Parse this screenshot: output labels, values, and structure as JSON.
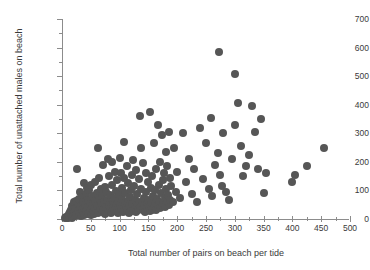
{
  "chart_data": {
    "type": "scatter",
    "title": "",
    "xlabel": "Total number of pairs on beach per tide",
    "ylabel": "Total number of unattached males on beach",
    "xlim": [
      0,
      500
    ],
    "ylim": [
      0,
      700
    ],
    "xticks": [
      0,
      50,
      100,
      150,
      200,
      250,
      300,
      350,
      400,
      450,
      500
    ],
    "xtick_labels": [
      "0",
      "50",
      "100",
      "150",
      "200",
      "250",
      "300",
      "350",
      "400",
      "450",
      "500"
    ],
    "xminor_step": 25,
    "yticks": [
      0,
      100,
      200,
      300,
      400,
      500,
      600,
      700
    ],
    "ytick_labels": [
      "0",
      "100",
      "200",
      "300",
      "400",
      "500",
      "600",
      "700"
    ],
    "yminor_step": 50,
    "grid": false,
    "legend": null,
    "marker": {
      "shape": "circle",
      "color": "#565656",
      "size_px": 8
    },
    "points": [
      [
        5,
        3
      ],
      [
        7,
        6
      ],
      [
        8,
        2
      ],
      [
        10,
        10
      ],
      [
        11,
        5
      ],
      [
        12,
        18
      ],
      [
        13,
        8
      ],
      [
        14,
        24
      ],
      [
        15,
        12
      ],
      [
        16,
        30
      ],
      [
        17,
        4
      ],
      [
        18,
        45
      ],
      [
        19,
        16
      ],
      [
        20,
        22
      ],
      [
        21,
        58
      ],
      [
        22,
        9
      ],
      [
        23,
        36
      ],
      [
        24,
        63
      ],
      [
        25,
        14
      ],
      [
        26,
        175
      ],
      [
        27,
        48
      ],
      [
        28,
        27
      ],
      [
        29,
        70
      ],
      [
        30,
        18
      ],
      [
        31,
        96
      ],
      [
        32,
        41
      ],
      [
        33,
        11
      ],
      [
        34,
        77
      ],
      [
        35,
        33
      ],
      [
        36,
        21
      ],
      [
        37,
        58
      ],
      [
        38,
        125
      ],
      [
        39,
        15
      ],
      [
        40,
        49
      ],
      [
        41,
        88
      ],
      [
        42,
        26
      ],
      [
        43,
        110
      ],
      [
        44,
        37
      ],
      [
        45,
        19
      ],
      [
        46,
        66
      ],
      [
        47,
        100
      ],
      [
        48,
        30
      ],
      [
        49,
        53
      ],
      [
        50,
        13
      ],
      [
        51,
        118
      ],
      [
        52,
        44
      ],
      [
        53,
        24
      ],
      [
        54,
        80
      ],
      [
        55,
        35
      ],
      [
        56,
        17
      ],
      [
        57,
        62
      ],
      [
        58,
        128
      ],
      [
        59,
        28
      ],
      [
        60,
        90
      ],
      [
        61,
        46
      ],
      [
        62,
        21
      ],
      [
        63,
        250
      ],
      [
        64,
        72
      ],
      [
        65,
        145
      ],
      [
        66,
        38
      ],
      [
        67,
        105
      ],
      [
        68,
        55
      ],
      [
        69,
        25
      ],
      [
        70,
        82
      ],
      [
        71,
        33
      ],
      [
        72,
        190
      ],
      [
        73,
        60
      ],
      [
        74,
        18
      ],
      [
        75,
        112
      ],
      [
        76,
        43
      ],
      [
        77,
        95
      ],
      [
        78,
        68
      ],
      [
        79,
        29
      ],
      [
        80,
        210
      ],
      [
        81,
        50
      ],
      [
        82,
        150
      ],
      [
        83,
        36
      ],
      [
        84,
        85
      ],
      [
        85,
        22
      ],
      [
        86,
        200
      ],
      [
        87,
        120
      ],
      [
        88,
        57
      ],
      [
        89,
        40
      ],
      [
        90,
        75
      ],
      [
        91,
        27
      ],
      [
        92,
        165
      ],
      [
        93,
        98
      ],
      [
        94,
        45
      ],
      [
        95,
        31
      ],
      [
        96,
        135
      ],
      [
        97,
        64
      ],
      [
        98,
        20
      ],
      [
        99,
        88
      ],
      [
        100,
        48
      ],
      [
        101,
        215
      ],
      [
        102,
        160
      ],
      [
        103,
        35
      ],
      [
        104,
        108
      ],
      [
        105,
        70
      ],
      [
        106,
        26
      ],
      [
        107,
        270
      ],
      [
        108,
        145
      ],
      [
        109,
        55
      ],
      [
        110,
        92
      ],
      [
        111,
        40
      ],
      [
        112,
        30
      ],
      [
        113,
        185
      ],
      [
        114,
        125
      ],
      [
        115,
        62
      ],
      [
        116,
        45
      ],
      [
        117,
        22
      ],
      [
        118,
        78
      ],
      [
        119,
        100
      ],
      [
        120,
        34
      ],
      [
        121,
        155
      ],
      [
        122,
        52
      ],
      [
        123,
        28
      ],
      [
        124,
        205
      ],
      [
        125,
        115
      ],
      [
        126,
        42
      ],
      [
        127,
        68
      ],
      [
        128,
        25
      ],
      [
        129,
        170
      ],
      [
        130,
        88
      ],
      [
        131,
        48
      ],
      [
        132,
        33
      ],
      [
        133,
        140
      ],
      [
        134,
        60
      ],
      [
        135,
        360
      ],
      [
        136,
        38
      ],
      [
        137,
        250
      ],
      [
        138,
        105
      ],
      [
        139,
        55
      ],
      [
        140,
        30
      ],
      [
        141,
        195
      ],
      [
        142,
        72
      ],
      [
        143,
        45
      ],
      [
        144,
        26
      ],
      [
        145,
        160
      ],
      [
        146,
        95
      ],
      [
        147,
        50
      ],
      [
        148,
        35
      ],
      [
        149,
        130
      ],
      [
        150,
        65
      ],
      [
        151,
        40
      ],
      [
        152,
        28
      ],
      [
        153,
        375
      ],
      [
        154,
        110
      ],
      [
        155,
        58
      ],
      [
        156,
        33
      ],
      [
        157,
        150
      ],
      [
        158,
        82
      ],
      [
        159,
        45
      ],
      [
        160,
        265
      ],
      [
        161,
        100
      ],
      [
        162,
        52
      ],
      [
        163,
        30
      ],
      [
        164,
        175
      ],
      [
        165,
        70
      ],
      [
        166,
        42
      ],
      [
        167,
        330
      ],
      [
        168,
        120
      ],
      [
        169,
        60
      ],
      [
        170,
        38
      ],
      [
        171,
        200
      ],
      [
        172,
        90
      ],
      [
        173,
        48
      ],
      [
        174,
        295
      ],
      [
        175,
        135
      ],
      [
        176,
        55
      ],
      [
        177,
        160
      ],
      [
        178,
        75
      ],
      [
        179,
        43
      ],
      [
        180,
        235
      ],
      [
        181,
        105
      ],
      [
        182,
        62
      ],
      [
        183,
        185
      ],
      [
        184,
        85
      ],
      [
        185,
        50
      ],
      [
        186,
        305
      ],
      [
        187,
        145
      ],
      [
        188,
        68
      ],
      [
        190,
        115
      ],
      [
        192,
        58
      ],
      [
        195,
        250
      ],
      [
        198,
        95
      ],
      [
        200,
        165
      ],
      [
        205,
        72
      ],
      [
        210,
        300
      ],
      [
        215,
        130
      ],
      [
        220,
        210
      ],
      [
        225,
        88
      ],
      [
        230,
        175
      ],
      [
        235,
        60
      ],
      [
        240,
        320
      ],
      [
        245,
        140
      ],
      [
        250,
        265
      ],
      [
        255,
        105
      ],
      [
        258,
        355
      ],
      [
        260,
        80
      ],
      [
        265,
        190
      ],
      [
        270,
        230
      ],
      [
        273,
        584
      ],
      [
        275,
        155
      ],
      [
        278,
        115
      ],
      [
        280,
        300
      ],
      [
        285,
        95
      ],
      [
        290,
        65
      ],
      [
        295,
        210
      ],
      [
        300,
        330
      ],
      [
        301,
        507
      ],
      [
        305,
        405
      ],
      [
        310,
        255
      ],
      [
        315,
        150
      ],
      [
        320,
        185
      ],
      [
        325,
        225
      ],
      [
        330,
        395
      ],
      [
        335,
        305
      ],
      [
        340,
        175
      ],
      [
        345,
        350
      ],
      [
        350,
        90
      ],
      [
        355,
        160
      ],
      [
        400,
        130
      ],
      [
        405,
        155
      ],
      [
        425,
        185
      ],
      [
        455,
        250
      ]
    ]
  }
}
